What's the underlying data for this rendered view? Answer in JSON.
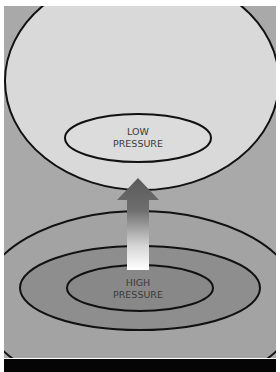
{
  "diagram": {
    "labels": {
      "low_line1": "LOW",
      "low_line2": "PRESSURE",
      "high_line1": "HIGH",
      "high_line2": "PRESSURE"
    },
    "colors": {
      "background": "#a9a9a9",
      "low_fill": "#d9d9d9",
      "outer_high": "#a3a3a3",
      "middle_high": "#8e8e8e",
      "inner_high": "#888888",
      "outline": "#111111",
      "bottom_bar": "#050505"
    },
    "arrow": {
      "direction": "up",
      "from": "high-pressure",
      "to": "low-pressure"
    }
  }
}
